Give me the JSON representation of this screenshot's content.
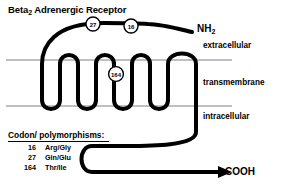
{
  "figure": {
    "title_main": "Beta",
    "title_sub": "2",
    "title_rest": " Adrenergic Receptor",
    "background_color": "#ffffff",
    "chain_color": "#000000",
    "membrane_line_color": "#808080"
  },
  "terminals": {
    "n_terminus": "NH",
    "n_terminus_sub": "2",
    "c_terminus": "COOH"
  },
  "compartments": {
    "extracellular": "extracellular",
    "transmembrane": "transmembrane",
    "intracellular": "intracellular"
  },
  "markers": [
    {
      "label": "27",
      "cx": 93,
      "cy": 24
    },
    {
      "label": "16",
      "cx": 131,
      "cy": 26
    },
    {
      "label": "164",
      "cx": 116,
      "cy": 74
    }
  ],
  "legend": {
    "title": "Codon/ polymorphisms:",
    "rows": [
      {
        "codon": "16",
        "polymorphism": "Arg/Gly"
      },
      {
        "codon": "27",
        "polymorphism": "Gln/Glu"
      },
      {
        "codon": "164",
        "polymorphism": "Thr/Ile"
      }
    ]
  }
}
